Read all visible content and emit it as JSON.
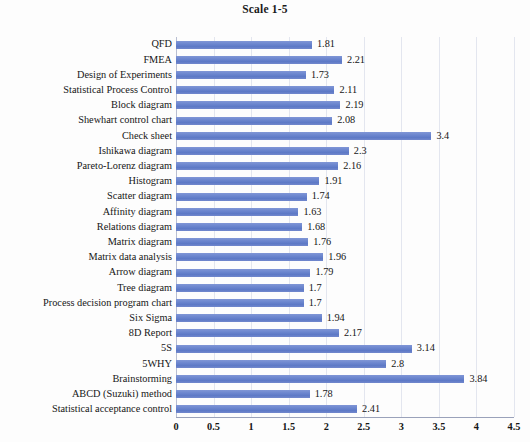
{
  "chart_data": {
    "type": "bar",
    "orientation": "horizontal",
    "title": "Scale 1-5",
    "xlabel": "",
    "ylabel": "",
    "xlim": [
      0,
      4.5
    ],
    "grid": true,
    "legend": false,
    "value_labels": true,
    "bar_color": "#6d87cf",
    "xticks": [
      0,
      0.5,
      1,
      1.5,
      2,
      2.5,
      3,
      3.5,
      4,
      4.5
    ],
    "xtick_labels": [
      "0",
      "0.5",
      "1",
      "1.5",
      "2",
      "2.5",
      "3",
      "3.5",
      "4",
      "4.5"
    ],
    "categories": [
      "QFD",
      "FMEA",
      "Design of Experiments",
      "Statistical Process Control",
      "Block diagram",
      "Shewhart control chart",
      "Check sheet",
      "Ishikawa diagram",
      "Pareto-Lorenz diagram",
      "Histogram",
      "Scatter diagram",
      "Affinity diagram",
      "Relations diagram",
      "Matrix diagram",
      "Matrix data analysis",
      "Arrow diagram",
      "Tree diagram",
      "Process decision program chart",
      "Six Sigma",
      "8D Report",
      "5S",
      "5WHY",
      "Brainstorming",
      "ABCD (Suzuki) method",
      "Statistical acceptance control"
    ],
    "values": [
      1.81,
      2.21,
      1.73,
      2.11,
      2.19,
      2.08,
      3.4,
      2.3,
      2.16,
      1.91,
      1.74,
      1.63,
      1.68,
      1.76,
      1.96,
      1.79,
      1.7,
      1.7,
      1.94,
      2.17,
      3.14,
      2.8,
      3.84,
      1.78,
      2.41
    ],
    "value_label_texts": [
      "1.81",
      "2.21",
      "1.73",
      "2.11",
      "2.19",
      "2.08",
      "3.4",
      "2.3",
      "2.16",
      "1.91",
      "1.74",
      "1.63",
      "1.68",
      "1.76",
      "1.96",
      "1.79",
      "1.7",
      "1.7",
      "1.94",
      "2.17",
      "3.14",
      "2.8",
      "3.84",
      "1.78",
      "2.41"
    ]
  }
}
